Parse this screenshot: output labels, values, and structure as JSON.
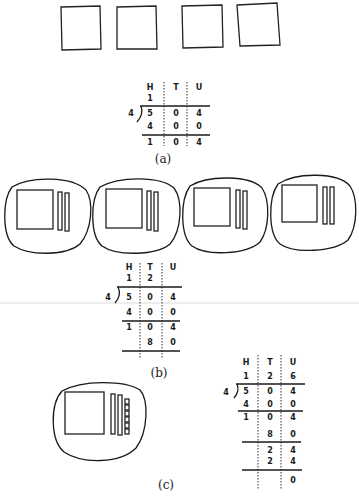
{
  "panels": {
    "a": {
      "caption": "(a)",
      "blocks": {
        "hundreds": 4
      },
      "table": {
        "headers": [
          "H",
          "T",
          "U"
        ],
        "divisor": "4",
        "quotient": [
          "1",
          "",
          ""
        ],
        "dividend": [
          "5",
          "0",
          "4"
        ],
        "rows": [
          [
            "4",
            "0",
            "0"
          ],
          [
            "1",
            "0",
            "4"
          ]
        ]
      }
    },
    "b": {
      "caption": "(b)",
      "groups": 4,
      "per_group": {
        "hundreds": 1,
        "tens": 2,
        "units": 0
      },
      "table": {
        "headers": [
          "H",
          "T",
          "U"
        ],
        "divisor": "4",
        "quotient": [
          "1",
          "2",
          ""
        ],
        "dividend": [
          "5",
          "0",
          "4"
        ],
        "rows": [
          [
            "4",
            "0",
            "0"
          ],
          [
            "1",
            "0",
            "4"
          ],
          [
            "",
            "8",
            "0"
          ]
        ]
      }
    },
    "c": {
      "caption": "(c)",
      "per_group": {
        "hundreds": 1,
        "tens": 2,
        "units": 6
      },
      "table": {
        "headers": [
          "H",
          "T",
          "U"
        ],
        "divisor": "4",
        "quotient": [
          "1",
          "2",
          "6"
        ],
        "dividend": [
          "5",
          "0",
          "4"
        ],
        "rows": [
          [
            "4",
            "0",
            "0"
          ],
          [
            "1",
            "0",
            "4"
          ],
          [
            "",
            "8",
            "0"
          ],
          [
            "",
            "2",
            "4"
          ],
          [
            "",
            "2",
            "4"
          ],
          [
            "",
            "",
            "0"
          ]
        ]
      }
    }
  },
  "colors": {
    "ink": "#1a1a1a",
    "background": "#ffffff",
    "rule": "#d8d8d8"
  }
}
